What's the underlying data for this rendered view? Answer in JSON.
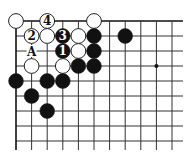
{
  "diagram": {
    "type": "go-board-fragment",
    "grid": {
      "origin_x": 16,
      "origin_y": 21,
      "dx": 15.6,
      "dy": 15,
      "cols": 12,
      "rows": 9,
      "line_right": 183,
      "line_bottom": 150,
      "line_color": "#333333",
      "edge_color": "#111111"
    },
    "star_points": [
      {
        "c": 9,
        "r": 3
      }
    ],
    "stones": [
      {
        "c": 0,
        "r": 0,
        "color": "white",
        "label": ""
      },
      {
        "c": 2,
        "r": 0,
        "color": "white",
        "label": "4"
      },
      {
        "c": 5,
        "r": 0,
        "color": "white",
        "label": ""
      },
      {
        "c": 1,
        "r": 1,
        "color": "white",
        "label": "2"
      },
      {
        "c": 2,
        "r": 1,
        "color": "white",
        "label": ""
      },
      {
        "c": 3,
        "r": 1,
        "color": "black",
        "label": "3"
      },
      {
        "c": 4,
        "r": 1,
        "color": "white",
        "label": ""
      },
      {
        "c": 5,
        "r": 1,
        "color": "black",
        "label": ""
      },
      {
        "c": 7,
        "r": 1,
        "color": "black",
        "label": ""
      },
      {
        "c": 3,
        "r": 2,
        "color": "black",
        "label": "1"
      },
      {
        "c": 4,
        "r": 2,
        "color": "white",
        "label": ""
      },
      {
        "c": 5,
        "r": 2,
        "color": "black",
        "label": ""
      },
      {
        "c": 1,
        "r": 3,
        "color": "white",
        "label": ""
      },
      {
        "c": 3,
        "r": 3,
        "color": "white",
        "label": ""
      },
      {
        "c": 4,
        "r": 3,
        "color": "black",
        "label": ""
      },
      {
        "c": 5,
        "r": 3,
        "color": "black",
        "label": ""
      },
      {
        "c": 0,
        "r": 4,
        "color": "black",
        "label": ""
      },
      {
        "c": 2,
        "r": 4,
        "color": "black",
        "label": ""
      },
      {
        "c": 3,
        "r": 4,
        "color": "black",
        "label": ""
      },
      {
        "c": 1,
        "r": 5,
        "color": "black",
        "label": ""
      },
      {
        "c": 2,
        "r": 6,
        "color": "black",
        "label": ""
      }
    ],
    "point_labels": [
      {
        "c": 1,
        "r": 2,
        "text": "A"
      }
    ],
    "colors": {
      "black_stone": "#111111",
      "white_stone": "#ffffff",
      "stone_outline": "#222222"
    }
  }
}
